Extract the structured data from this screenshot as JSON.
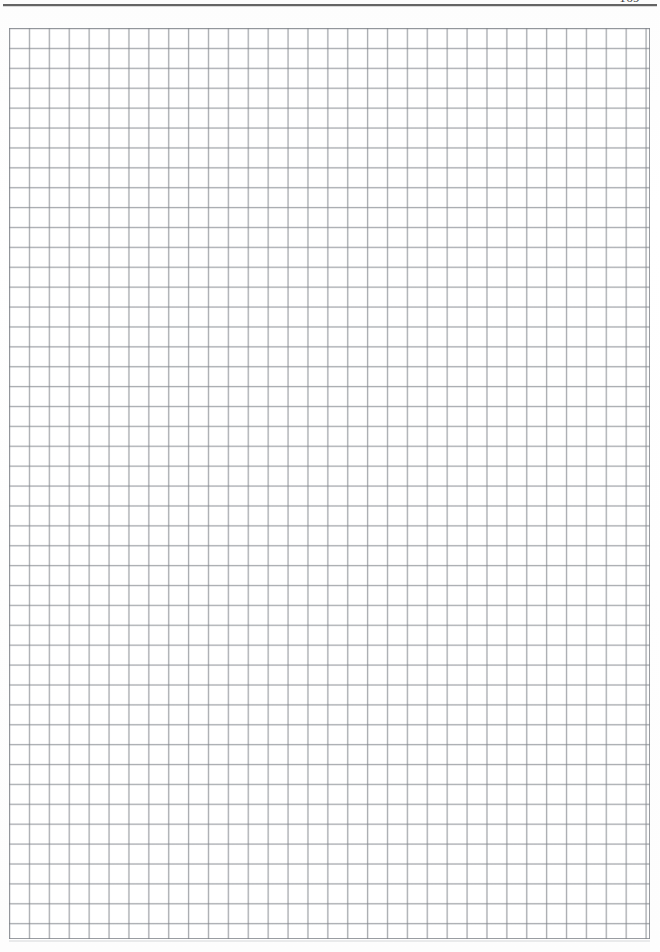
{
  "document": {
    "kind": "scanned-notebook-page",
    "page_number": "169",
    "background_color": "#fefefe"
  },
  "header": {
    "rule_color": "#575757",
    "page_number": "169"
  },
  "grid": {
    "label": "Squared graph-paper grid",
    "columns": 32,
    "rows": 46,
    "cell_size_px": "19.9",
    "line_color": "#787c82",
    "minor_line_color": "#afb2b7",
    "fill_color": "#ffffff",
    "left_px": 9,
    "top_px": 28,
    "width_px": 641,
    "height_px": 911
  }
}
